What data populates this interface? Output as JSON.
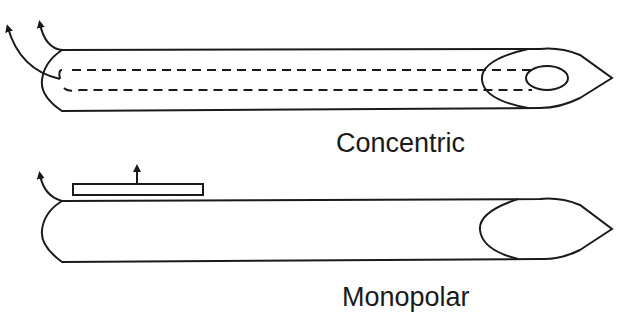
{
  "diagram": {
    "type": "needle-electrode-comparison",
    "colors": {
      "stroke": "#1a1a1a",
      "background": "#ffffff"
    },
    "needles": [
      {
        "id": "concentric",
        "label": "Concentric",
        "features": [
          "outer cannula",
          "inner core wire (dashed)",
          "bevel",
          "core recording surface (oval)",
          "two lead arrows"
        ]
      },
      {
        "id": "monopolar",
        "label": "Monopolar",
        "features": [
          "solid needle shaft",
          "bevel tip",
          "surface reference electrode plate",
          "two lead arrows"
        ]
      }
    ]
  }
}
